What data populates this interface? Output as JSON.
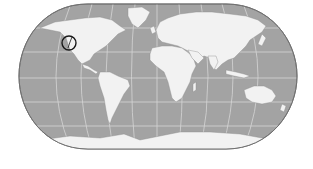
{
  "map": {
    "type": "world-map",
    "projection": "pseudocylindrical (rounded sides)",
    "ocean_color": "#a3a3a3",
    "land_color": "#f2f2f2",
    "graticule_color": "#d9d9d9",
    "border_color": "#7a7a7a",
    "marker": {
      "shape": "circle",
      "stroke_color": "#1a1a1a",
      "location_description": "North American west coast",
      "x": 69,
      "y": 43,
      "r": 7
    }
  }
}
